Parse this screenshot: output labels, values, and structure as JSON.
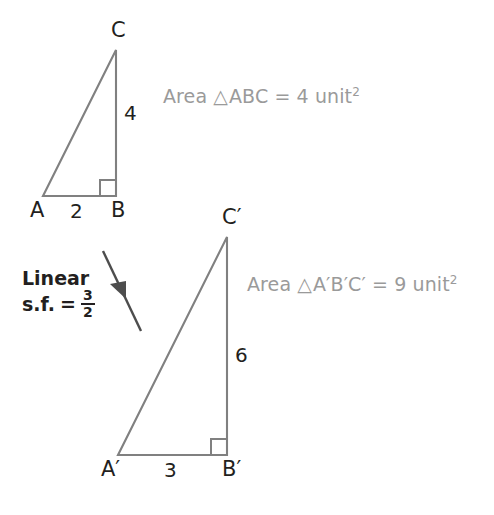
{
  "canvas": {
    "width": 494,
    "height": 515,
    "background": "#ffffff"
  },
  "style": {
    "stroke_color": "#808080",
    "text_dark": "#231f20",
    "text_gray": "#9a9a9a",
    "arrow_color": "#4d4d4d"
  },
  "diagram": {
    "title_hidden": "Similar right triangles with linear scale factor",
    "triangle_small": {
      "vertices": {
        "A": {
          "label": "A",
          "x": 43,
          "y": 196
        },
        "B": {
          "label": "B",
          "x": 116,
          "y": 196
        },
        "C": {
          "label": "C",
          "x": 116,
          "y": 50
        }
      },
      "side_labels": {
        "base": "2",
        "height": "4"
      },
      "right_angle_at": "B",
      "area_label": {
        "prefix": "Area",
        "triangle_symbol": "△",
        "name": "ABC",
        "equals": "=",
        "value": "4",
        "unit": "unit",
        "exponent": "2"
      }
    },
    "triangle_large": {
      "vertices": {
        "A'": {
          "label": "A′",
          "x": 118,
          "y": 455
        },
        "B'": {
          "label": "B′",
          "x": 227,
          "y": 455
        },
        "C'": {
          "label": "C′",
          "x": 227,
          "y": 237
        }
      },
      "side_labels": {
        "base": "3",
        "height": "6"
      },
      "right_angle_at": "B'",
      "area_label": {
        "prefix": "Area",
        "triangle_symbol": "△",
        "name": "A′B′C′",
        "equals": "=",
        "value": "9",
        "unit": "unit",
        "exponent": "2"
      }
    },
    "scale_factor": {
      "line1": "Linear",
      "line2_prefix": "s.f.",
      "equals": "=",
      "numerator": "3",
      "denominator": "2"
    },
    "arrow": {
      "name": "transformation-arrow",
      "from": {
        "x": 103,
        "y": 251
      },
      "to": {
        "x": 141,
        "y": 331
      },
      "head_at": {
        "x": 122,
        "y": 291
      },
      "direction": "down-right"
    }
  }
}
